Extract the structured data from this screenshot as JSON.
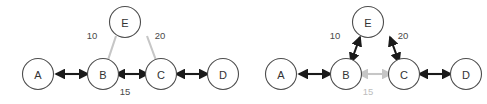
{
  "figure": {
    "background": "#ffffff",
    "width": 487,
    "height": 104
  },
  "colors": {
    "node_stroke": "#4d4d4d",
    "node_fill": "#ffffff",
    "node_text": "#333333",
    "edge_strong": "#1a1a1a",
    "edge_faint": "#c6c6c6",
    "label_strong": "#4a4a4a",
    "label_faint": "#bdbdbd"
  },
  "nodes": {
    "A": {
      "label": "A"
    },
    "B": {
      "label": "B"
    },
    "C": {
      "label": "C"
    },
    "D": {
      "label": "D"
    },
    "E": {
      "label": "E"
    }
  },
  "panels": [
    {
      "id": "left",
      "name": "panel-left",
      "edges": [
        {
          "id": "A-B",
          "from": "A",
          "to": "B",
          "style": "strong",
          "arrows": "both",
          "weight": null
        },
        {
          "id": "B-C",
          "from": "B",
          "to": "C",
          "style": "strong",
          "arrows": "both",
          "weight": "15"
        },
        {
          "id": "C-D",
          "from": "C",
          "to": "D",
          "style": "strong",
          "arrows": "both",
          "weight": null
        },
        {
          "id": "B-E",
          "from": "B",
          "to": "E",
          "style": "faint",
          "arrows": "none",
          "weight": "10"
        },
        {
          "id": "C-E",
          "from": "C",
          "to": "E",
          "style": "faint",
          "arrows": "none",
          "weight": "20"
        }
      ],
      "weights": {
        "BE": "10",
        "CE": "20",
        "BC": "15"
      }
    },
    {
      "id": "right",
      "name": "panel-right",
      "edges": [
        {
          "id": "A-B",
          "from": "A",
          "to": "B",
          "style": "strong",
          "arrows": "both",
          "weight": null
        },
        {
          "id": "B-C",
          "from": "B",
          "to": "C",
          "style": "faint",
          "arrows": "both",
          "weight": "15"
        },
        {
          "id": "C-D",
          "from": "C",
          "to": "D",
          "style": "strong",
          "arrows": "both",
          "weight": null
        },
        {
          "id": "B-E",
          "from": "B",
          "to": "E",
          "style": "strong",
          "arrows": "both",
          "weight": "10"
        },
        {
          "id": "C-E",
          "from": "C",
          "to": "E",
          "style": "strong",
          "arrows": "both",
          "weight": "20"
        }
      ],
      "weights": {
        "BE": "10",
        "CE": "20",
        "BC": "15"
      }
    }
  ]
}
